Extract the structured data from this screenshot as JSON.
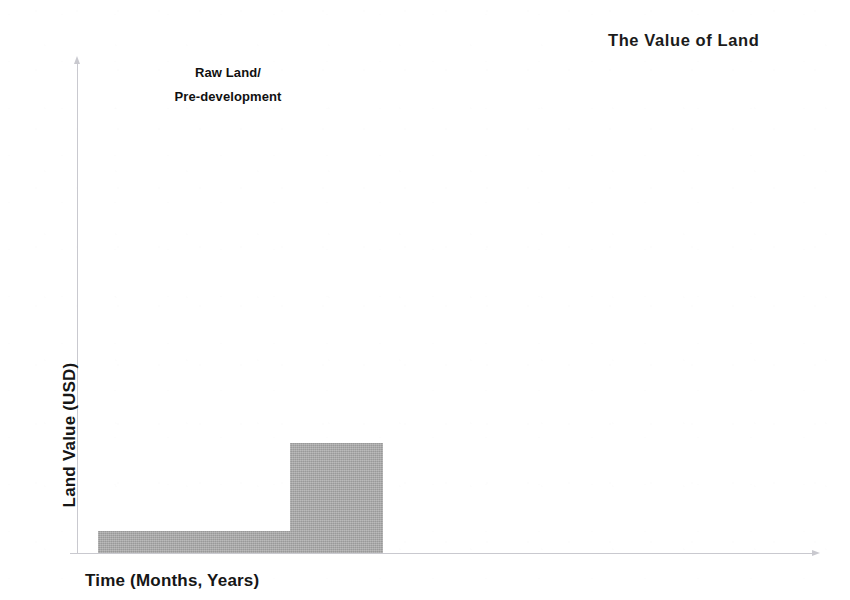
{
  "chart_data": {
    "type": "bar",
    "title": "The Value of Land",
    "xlabel": "Time (Months, Years)",
    "ylabel": "Land Value (USD)",
    "grid": false,
    "legend": null,
    "legend_position": "none",
    "axis_style": "arrow-axes",
    "axis_color": "#c9c9cf",
    "series_color": "#a8a8a8",
    "background": "#ffffff",
    "xlim": [
      0,
      100
    ],
    "ylim": [
      0,
      100
    ],
    "x_tick_labels": [],
    "y_tick_labels": [],
    "categories": [
      "Raw Land / Pre-development",
      "Early development"
    ],
    "values": [
      4.5,
      22.4
    ],
    "steps": [
      {
        "label": "Raw Land / Pre-development",
        "x_start": 2.8,
        "x_end": 28.9,
        "value": 4.5
      },
      {
        "label": "Early development",
        "x_start": 28.9,
        "x_end": 41.4,
        "value": 22.4
      }
    ],
    "annotations": [
      {
        "name": "raw-land-annotation",
        "lines": [
          "Raw Land/",
          "Pre-development"
        ],
        "line1": "Raw Land/",
        "line2": "Pre-development",
        "target_step": 0
      }
    ]
  }
}
